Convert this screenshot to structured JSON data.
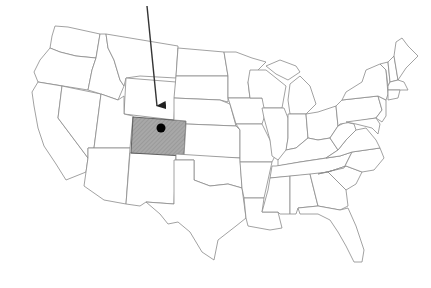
{
  "map": {
    "title": "United States map highlighting Colorado",
    "highlighted_state": "Colorado",
    "highlight_fill": "#9a9a9a",
    "outline_color": "#8a8a8a",
    "marker": {
      "type": "dot",
      "color": "#000000",
      "location": "Colorado"
    },
    "arrow": {
      "color": "#333333",
      "points_to": "Colorado"
    }
  }
}
